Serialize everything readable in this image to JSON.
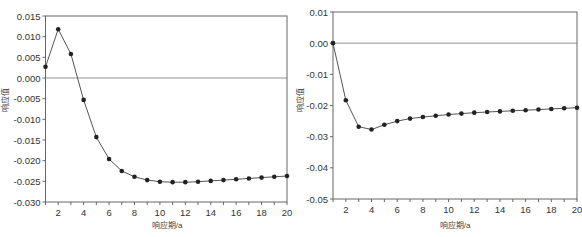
{
  "chart_data": [
    {
      "type": "line",
      "title": "",
      "xlabel": "响应期/a",
      "ylabel": "响应值",
      "xlim": [
        1,
        20
      ],
      "ylim": [
        -0.03,
        0.015
      ],
      "xticks": [
        2,
        4,
        6,
        8,
        10,
        12,
        14,
        16,
        18,
        20
      ],
      "yticks": [
        0.015,
        0.01,
        0.005,
        0.0,
        -0.005,
        -0.01,
        -0.015,
        -0.02,
        -0.025,
        -0.03
      ],
      "ytick_labels": [
        "0.015",
        "0.010",
        "0.005",
        "0.000",
        "-0.005",
        "-0.010",
        "-0.015",
        "-0.020",
        "-0.025",
        "-0.030"
      ],
      "grid": false,
      "zero_line": true,
      "markers": "circle",
      "x": [
        1,
        2,
        3,
        4,
        5,
        6,
        7,
        8,
        9,
        10,
        11,
        12,
        13,
        14,
        15,
        16,
        17,
        18,
        19,
        20
      ],
      "series": [
        {
          "name": "response",
          "values": [
            0.0027,
            0.0118,
            0.0058,
            -0.0053,
            -0.0143,
            -0.0196,
            -0.0225,
            -0.0239,
            -0.0247,
            -0.0251,
            -0.0252,
            -0.0252,
            -0.0251,
            -0.0249,
            -0.0247,
            -0.0245,
            -0.0243,
            -0.0241,
            -0.0239,
            -0.0237
          ]
        }
      ]
    },
    {
      "type": "line",
      "title": "",
      "xlabel": "响应期/a",
      "ylabel": "响应值",
      "xlim": [
        1,
        20
      ],
      "ylim": [
        -0.05,
        0.01
      ],
      "xticks": [
        2,
        4,
        6,
        8,
        10,
        12,
        14,
        16,
        18,
        20
      ],
      "yticks": [
        0.01,
        0.0,
        -0.01,
        -0.02,
        -0.03,
        -0.04,
        -0.05
      ],
      "ytick_labels": [
        "0.01",
        "0.00",
        "-0.01",
        "-0.02",
        "-0.03",
        "-0.04",
        "-0.05"
      ],
      "grid": false,
      "zero_line": true,
      "markers": "circle",
      "x": [
        1,
        2,
        3,
        4,
        5,
        6,
        7,
        8,
        9,
        10,
        11,
        12,
        13,
        14,
        15,
        16,
        17,
        18,
        19,
        20
      ],
      "series": [
        {
          "name": "response",
          "values": [
            0.0,
            -0.0183,
            -0.0268,
            -0.0277,
            -0.0262,
            -0.025,
            -0.0242,
            -0.0237,
            -0.0233,
            -0.0229,
            -0.0226,
            -0.0223,
            -0.0221,
            -0.0219,
            -0.0217,
            -0.0215,
            -0.0213,
            -0.0211,
            -0.0209,
            -0.0207
          ]
        }
      ]
    }
  ],
  "colors": {
    "line": "#555555",
    "marker": "#222222",
    "axis": "#666666",
    "zero_line": "#777777"
  }
}
